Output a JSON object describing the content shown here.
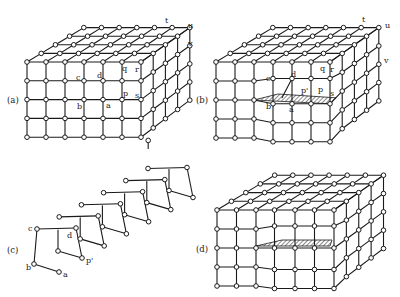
{
  "figure": {
    "colors": {
      "line": "#1a1a1a",
      "node_fill": "#ffffff",
      "background": "#ffffff"
    }
  },
  "panels": [
    {
      "id": "a",
      "label": "(a)",
      "label_pos": [
        14,
        100
      ],
      "lattice": {
        "origin": [
          27,
          62
        ],
        "cols": 7,
        "rows": 5,
        "depth": 5,
        "dx": 19,
        "dy": 18.8,
        "ddx": 13.2,
        "ddy": -8.6,
        "back_scale": 0.93
      },
      "point_labels": [
        {
          "text": "a",
          "x": 106,
          "y": 108
        },
        {
          "text": "b",
          "x": 77,
          "y": 109
        },
        {
          "text": "c",
          "x": 76,
          "y": 80
        },
        {
          "text": "d",
          "x": 97,
          "y": 78
        },
        {
          "text": "p",
          "x": 123,
          "y": 96
        },
        {
          "text": "q",
          "x": 122,
          "y": 71
        },
        {
          "text": "r",
          "x": 135,
          "y": 72
        },
        {
          "text": "s",
          "x": 135,
          "y": 98
        },
        {
          "text": "t",
          "x": 165,
          "y": 23
        },
        {
          "text": "u",
          "x": 188,
          "y": 28
        },
        {
          "text": "v",
          "x": 188,
          "y": 46
        }
      ]
    },
    {
      "id": "b",
      "label": "(b)",
      "label_pos": [
        203,
        100
      ],
      "lattice": {
        "origin": [
          216,
          62
        ],
        "cols": 7,
        "rows": 5,
        "depth": 5,
        "dx": 19,
        "dy": 19,
        "ddx": 13.2,
        "ddy": -8.6,
        "back_scale": 0.93
      },
      "point_labels": [
        {
          "text": "a",
          "x": 289,
          "y": 112
        },
        {
          "text": "b",
          "x": 266,
          "y": 109
        },
        {
          "text": "c",
          "x": 266,
          "y": 81
        },
        {
          "text": "d",
          "x": 291,
          "y": 77
        },
        {
          "text": "p'",
          "x": 301,
          "y": 93
        },
        {
          "text": "p",
          "x": 318,
          "y": 92
        },
        {
          "text": "q",
          "x": 320,
          "y": 71
        },
        {
          "text": "r",
          "x": 330,
          "y": 72
        },
        {
          "text": "s",
          "x": 330,
          "y": 96
        },
        {
          "text": "t",
          "x": 362,
          "y": 22
        },
        {
          "text": "u",
          "x": 385,
          "y": 28
        },
        {
          "text": "v",
          "x": 384,
          "y": 63
        }
      ]
    },
    {
      "id": "c",
      "label": "(c)",
      "label_pos": [
        14,
        250
      ],
      "chain": {
        "origin": [
          37,
          229
        ],
        "units": 6,
        "step": [
          22.2,
          -12.1
        ]
      },
      "point_labels": [
        {
          "text": "a",
          "x": 63,
          "y": 277
        },
        {
          "text": "b",
          "x": 26,
          "y": 270
        },
        {
          "text": "c",
          "x": 28,
          "y": 231
        },
        {
          "text": "d",
          "x": 67,
          "y": 238
        },
        {
          "text": "p'",
          "x": 86,
          "y": 263
        }
      ]
    },
    {
      "id": "d",
      "label": "(d)",
      "label_pos": [
        203,
        250
      ],
      "lattice": {
        "origin": [
          217,
          210
        ],
        "cols": 7,
        "rows": 5,
        "depth": 5,
        "dx": 19.5,
        "dy": 19,
        "ddx": 13.4,
        "ddy": -8.7,
        "back_scale": 0.93
      },
      "point_labels": []
    }
  ]
}
